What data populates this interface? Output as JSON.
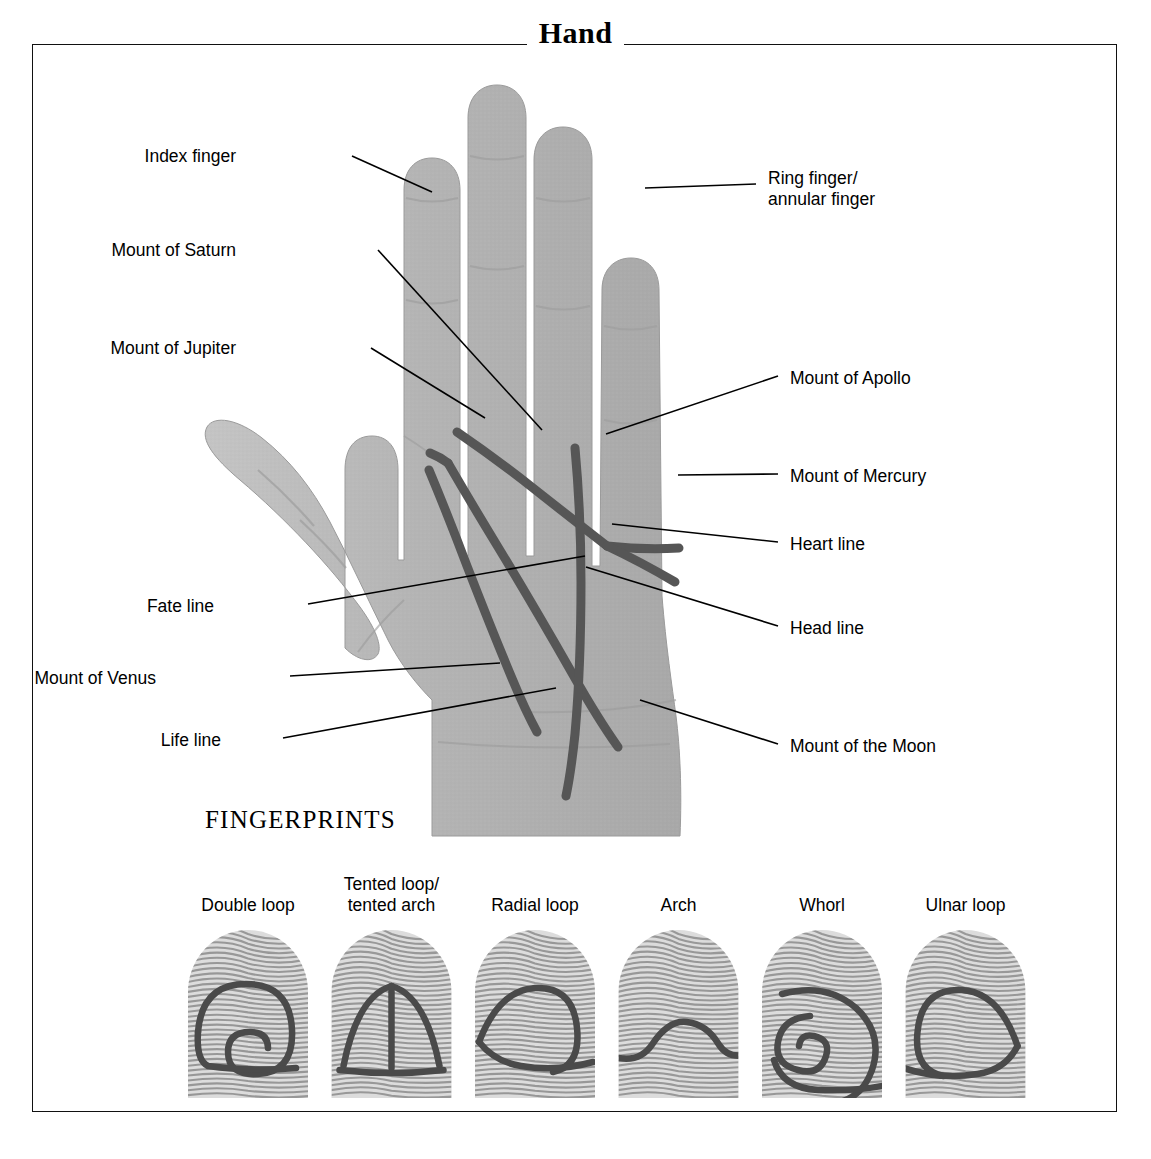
{
  "title": "Hand",
  "labels_left": [
    {
      "text": "Index finger",
      "x": 236,
      "y": 146
    },
    {
      "text": "Mount of Saturn",
      "x": 236,
      "y": 240
    },
    {
      "text": "Mount of Jupiter",
      "x": 236,
      "y": 338
    },
    {
      "text": "Fate line",
      "x": 214,
      "y": 596
    },
    {
      "text": "Mount of Venus",
      "x": 156,
      "y": 668
    },
    {
      "text": "Life line",
      "x": 221,
      "y": 730
    }
  ],
  "labels_right": [
    {
      "text": "Ring finger/\nannular finger",
      "x": 768,
      "y": 168
    },
    {
      "text": "Mount of Apollo",
      "x": 790,
      "y": 368
    },
    {
      "text": "Mount of Mercury",
      "x": 790,
      "y": 466
    },
    {
      "text": "Heart line",
      "x": 790,
      "y": 534
    },
    {
      "text": "Head line",
      "x": 790,
      "y": 618
    },
    {
      "text": "Mount of the Moon",
      "x": 790,
      "y": 736
    }
  ],
  "fingerprints": {
    "heading": "FINGERPRINTS",
    "items": [
      {
        "label": "Double loop",
        "pattern": "double-loop"
      },
      {
        "label": "Tented loop/\ntented arch",
        "pattern": "tented-arch"
      },
      {
        "label": "Radial loop",
        "pattern": "radial-loop"
      },
      {
        "label": "Arch",
        "pattern": "arch"
      },
      {
        "label": "Whorl",
        "pattern": "whorl"
      },
      {
        "label": "Ulnar loop",
        "pattern": "ulnar-loop"
      }
    ]
  },
  "colors": {
    "frame": "#111111",
    "skin": "#b9b9b9",
    "palm_line": "#555555",
    "leader": "#000000",
    "ridge": "#8c8c8c",
    "ridge_highlight": "#4a4a4a"
  }
}
